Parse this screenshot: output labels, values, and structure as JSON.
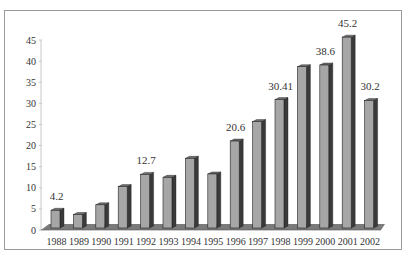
{
  "chart_data": {
    "type": "bar",
    "title": "",
    "xlabel": "",
    "ylabel": "",
    "categories": [
      "1988",
      "1989",
      "1990",
      "1991",
      "1992",
      "1993",
      "1994",
      "1995",
      "1996",
      "1997",
      "1998",
      "1999",
      "2000",
      "2001",
      "2002"
    ],
    "values": [
      4.2,
      3.2,
      5.5,
      9.8,
      12.7,
      12.0,
      16.5,
      12.8,
      20.6,
      25.2,
      30.41,
      38.2,
      38.6,
      45.2,
      30.2
    ],
    "data_labels": {
      "0": "4.2",
      "4": "12.7",
      "8": "20.6",
      "10": "30.41",
      "12": "38.6",
      "13": "45.2",
      "14": "30.2"
    },
    "ylim": [
      0,
      45
    ],
    "yticks": [
      "0",
      "5",
      "10",
      "15",
      "20",
      "25",
      "30",
      "35",
      "40",
      "45"
    ],
    "grid": false,
    "legend": null,
    "style": "3d-column",
    "colors": {
      "bar_face": "#a6a6a6",
      "bar_side": "#3a3a3a",
      "bar_top": "#6e6e6e",
      "floor": "#7a7a7a",
      "frame": "#9a9a9a"
    }
  }
}
